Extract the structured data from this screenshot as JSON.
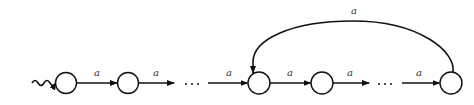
{
  "diagram": {
    "type": "automaton",
    "colors": {
      "stroke": "#111111",
      "label": "#333333",
      "background": "#ffffff"
    },
    "start_arrow": {
      "style": "wavy"
    },
    "states": [
      {
        "id": "s1",
        "cx": 66,
        "cy": 83
      },
      {
        "id": "s2",
        "cx": 128,
        "cy": 83
      },
      {
        "id": "s3",
        "cx": 259,
        "cy": 83
      },
      {
        "id": "s4",
        "cx": 322,
        "cy": 83
      },
      {
        "id": "s5",
        "cx": 451,
        "cy": 83
      }
    ],
    "edges": [
      {
        "from": "s1",
        "to": "s2",
        "label": "a"
      },
      {
        "from": "s2",
        "to": "ellipsis1",
        "label": "a"
      },
      {
        "from": "ellipsis1",
        "to": "s3",
        "label": "a"
      },
      {
        "from": "s3",
        "to": "s4",
        "label": "a"
      },
      {
        "from": "s4",
        "to": "ellipsis2",
        "label": "a"
      },
      {
        "from": "ellipsis2",
        "to": "s5",
        "label": "a"
      },
      {
        "from": "s5",
        "to": "s3",
        "label": "a",
        "shape": "arc-above"
      }
    ],
    "ellipsis": "· · ·"
  }
}
